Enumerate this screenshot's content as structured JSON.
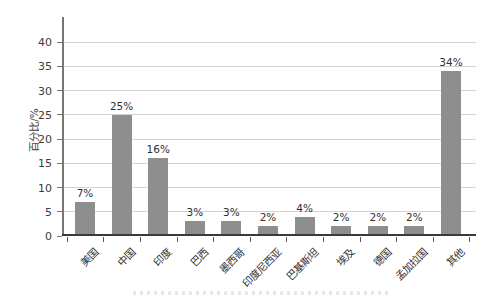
{
  "figure": {
    "background": "#ffffff"
  },
  "chart_data": {
    "type": "bar",
    "title": "",
    "categories": [
      "美国",
      "中国",
      "印度",
      "巴西",
      "墨西哥",
      "印度尼西亚",
      "巴基斯坦",
      "埃及",
      "德国",
      "孟加拉国",
      "其他"
    ],
    "values": [
      7,
      25,
      16,
      3,
      3,
      2,
      4,
      2,
      2,
      2,
      34
    ],
    "bar_labels": [
      "7%",
      "25%",
      "16%",
      "3%",
      "3%",
      "2%",
      "4%",
      "2%",
      "2%",
      "2%",
      "34%"
    ],
    "xlabel": "",
    "ylabel": "百分比/%",
    "yticks": [
      0,
      5,
      10,
      15,
      20,
      25,
      30,
      35,
      40
    ],
    "ylim": [
      0,
      45
    ],
    "grid": "horizontal",
    "legend": "none",
    "bar_color": "#8e8e8e",
    "gridline_color": "#d2d2d2",
    "y_axis_color": "#757575",
    "x_axis_color": "#3a3a3a",
    "text_color": "#333333"
  }
}
